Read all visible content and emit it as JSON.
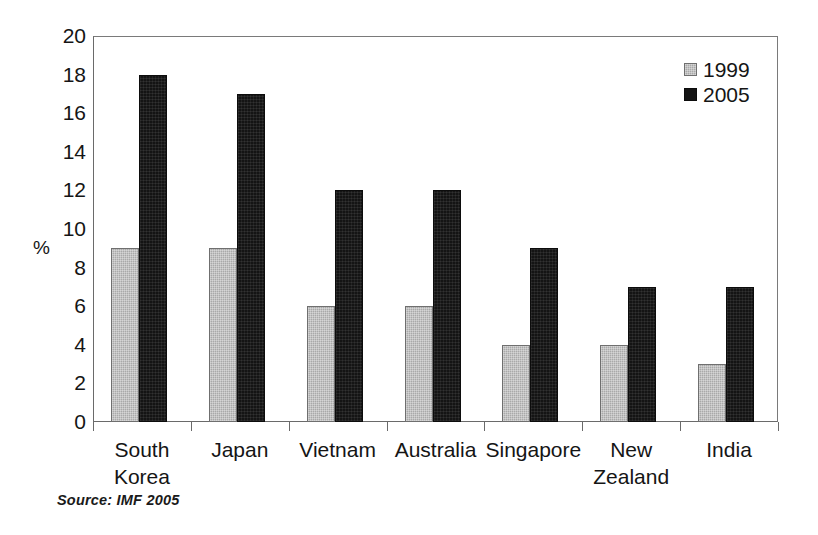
{
  "chart_data": {
    "type": "bar",
    "title": "",
    "subtitle": "",
    "xlabel": "",
    "ylabel": "%",
    "ylim": [
      0,
      20
    ],
    "y_tick_step": 2,
    "y_ticks": [
      20,
      18,
      16,
      14,
      12,
      10,
      8,
      6,
      4,
      2,
      0
    ],
    "grid": false,
    "legend_position": "top-right",
    "categories": [
      "South\nKorea",
      "Japan",
      "Vietnam",
      "Australia",
      "Singapore",
      "New\nZealand",
      "India"
    ],
    "series": [
      {
        "name": "1999",
        "color": "#a9a9a9",
        "values": [
          9,
          9,
          6,
          6,
          4,
          4,
          3
        ]
      },
      {
        "name": "2005",
        "color": "#141414",
        "values": [
          18,
          17,
          12,
          12,
          9,
          7,
          7
        ]
      }
    ],
    "annotations": [
      "Source:  IMF 2005"
    ]
  },
  "legend": {
    "entries": [
      {
        "label": "1999"
      },
      {
        "label": "2005"
      }
    ]
  },
  "source": {
    "text": "Source:  IMF 2005"
  }
}
